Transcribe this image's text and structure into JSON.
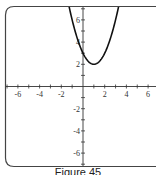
{
  "caption": "Figure 45",
  "chart_data": {
    "type": "line",
    "title": "",
    "xlabel": "",
    "ylabel": "",
    "xlim": [
      -7,
      7
    ],
    "ylim": [
      -7,
      7.2
    ],
    "grid": false,
    "legend": null,
    "xticks": [
      -6,
      -4,
      -2,
      2,
      4,
      6
    ],
    "yticks": [
      -6,
      -4,
      -2,
      2,
      4,
      6
    ],
    "xtick_labels": [
      "-6",
      "-4",
      "-2",
      "2",
      "4",
      "6"
    ],
    "ytick_labels": [
      "-6",
      "-4",
      "-2",
      "2",
      "4",
      "6"
    ],
    "series": [
      {
        "name": "f(x) = (x - 1)^2 + 2",
        "x": [
          -1.3,
          -1,
          -0.5,
          0,
          0.5,
          1,
          1.5,
          2,
          2.5,
          3,
          3.3
        ],
        "y": [
          7.29,
          6,
          4.25,
          3,
          2.25,
          2,
          2.25,
          3,
          4.25,
          6,
          7.29
        ]
      }
    ],
    "annotations": [
      {
        "text": "vertex",
        "x": 1,
        "y": 2
      },
      {
        "text": "y-intercept",
        "x": 0,
        "y": 3
      }
    ]
  },
  "colors": {
    "curve": "#111111",
    "axes": "#333333",
    "frame": "#444444"
  }
}
